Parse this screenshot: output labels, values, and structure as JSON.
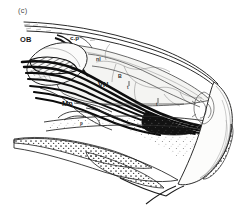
{
  "figure": {
    "panel_label": "(c)",
    "ink_color": "#111111",
    "line_color": "#2b2b2b",
    "wash_color": "#f2f2f0",
    "background": "#ffffff"
  },
  "annotations": [
    {
      "key": "ob",
      "label": "OB",
      "x": 20,
      "y": 36,
      "size": "big",
      "note": "olfactory bulb"
    },
    {
      "key": "cp",
      "label": "c.p",
      "x": 70,
      "y": 35,
      "size": "mid",
      "note": "cribriform plate"
    },
    {
      "key": "nl",
      "label": "nl",
      "x": 96,
      "y": 57,
      "size": "small",
      "note": "nerve layer"
    },
    {
      "key": "b",
      "label": "B",
      "x": 118,
      "y": 74,
      "size": "small",
      "note": "bone"
    },
    {
      "key": "vn",
      "label": "VN",
      "x": 98,
      "y": 81,
      "size": "big",
      "note": "vomeronasal nerve"
    },
    {
      "key": "mn",
      "label": "Mn",
      "x": 62,
      "y": 100,
      "size": "big",
      "note": "medial nerve bundle"
    },
    {
      "key": "t1",
      "label": "t",
      "x": 127,
      "y": 86,
      "size": "tiny",
      "note": "turbinate marker"
    },
    {
      "key": "t2",
      "label": "t",
      "x": 156,
      "y": 103,
      "size": "tiny",
      "note": "turbinate marker"
    },
    {
      "key": "p",
      "label": "p",
      "x": 80,
      "y": 122,
      "size": "tiny",
      "note": "palate marker"
    }
  ]
}
